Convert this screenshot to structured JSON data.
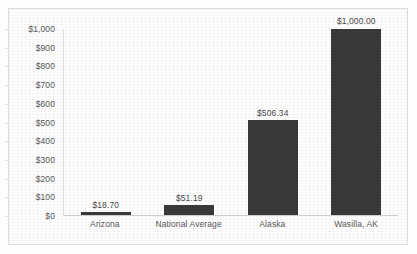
{
  "document": {
    "cut_off_top_text": "",
    "background_color": "#ffffff",
    "frame_color": "#dcdcdc"
  },
  "chart_data": {
    "type": "bar",
    "title": "",
    "subtitle": "",
    "xlabel": "",
    "ylabel": "",
    "categories": [
      "Arizona",
      "National Average",
      "Alaska",
      "Wasilla, AK"
    ],
    "values": [
      18.7,
      51.19,
      506.34,
      1000.0
    ],
    "data_labels": [
      "$18.70",
      "$51.19",
      "$506.34",
      "$1,000.00"
    ],
    "ylim": [
      0,
      1000
    ],
    "ytick_values": [
      1000,
      900,
      800,
      700,
      600,
      500,
      400,
      300,
      200,
      100,
      0
    ],
    "ytick_labels": [
      "$1,000",
      "$900",
      "$800",
      "$700",
      "$600",
      "$500",
      "$400",
      "$300",
      "$200",
      "$100",
      "$0"
    ],
    "grid": false,
    "legend": false,
    "legend_position": "none",
    "bar_color": "#3a3a3a",
    "axis_label_color": "#595959",
    "data_label_color": "#4a4a4a"
  }
}
